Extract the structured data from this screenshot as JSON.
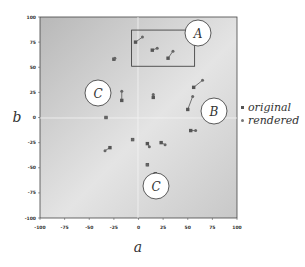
{
  "chart_data": {
    "type": "scatter",
    "title": "",
    "xlabel": "a",
    "ylabel": "b",
    "xlim": [
      -100,
      100
    ],
    "ylim": [
      -100,
      100
    ],
    "x_ticks": [
      "-100",
      "-75",
      "-50",
      "-25",
      "0",
      "25",
      "50",
      "75",
      "100"
    ],
    "y_ticks": [
      "100",
      "75",
      "50",
      "25",
      "0",
      "-25",
      "-50",
      "-75",
      "-100"
    ],
    "grid": false,
    "zero_lines": true,
    "legend": {
      "position": "right",
      "entries": [
        {
          "label": "original",
          "marker": "square"
        },
        {
          "label": "rendered",
          "marker": "dot"
        }
      ]
    },
    "pairs": [
      {
        "original": [
          -3,
          75
        ],
        "rendered": [
          4,
          80
        ]
      },
      {
        "original": [
          14,
          67
        ],
        "rendered": [
          19,
          69
        ]
      },
      {
        "original": [
          30,
          59
        ],
        "rendered": [
          35,
          66
        ]
      },
      {
        "original": [
          56,
          30
        ],
        "rendered": [
          65,
          37
        ]
      },
      {
        "original": [
          50,
          8
        ],
        "rendered": [
          55,
          21
        ]
      },
      {
        "original": [
          53,
          -13
        ],
        "rendered": [
          58,
          -13
        ]
      },
      {
        "original": [
          -25,
          58
        ],
        "rendered": [
          -24,
          59
        ]
      },
      {
        "original": [
          -17,
          17
        ],
        "rendered": [
          -17,
          26
        ]
      },
      {
        "original": [
          -33,
          0
        ],
        "rendered": [
          -33,
          0
        ]
      },
      {
        "original": [
          15,
          20
        ],
        "rendered": [
          15,
          23
        ]
      },
      {
        "original": [
          -29,
          -30
        ],
        "rendered": [
          -34,
          -33
        ]
      },
      {
        "original": [
          -6,
          -22
        ],
        "rendered": [
          -6,
          -22
        ]
      },
      {
        "original": [
          9,
          -26
        ],
        "rendered": [
          11,
          -29
        ]
      },
      {
        "original": [
          23,
          -25
        ],
        "rendered": [
          27,
          -27
        ]
      },
      {
        "original": [
          9,
          -47
        ],
        "rendered": [
          9,
          -47
        ]
      },
      {
        "original": [
          17,
          -56
        ],
        "rendered": [
          17,
          -56
        ]
      }
    ],
    "annotations": [
      {
        "label": "A",
        "type": "circle",
        "at": [
          61,
          85
        ]
      },
      {
        "label": "B",
        "type": "circle",
        "at": [
          77,
          7
        ]
      },
      {
        "label": "C",
        "type": "circle",
        "at": [
          -41,
          25
        ]
      },
      {
        "label": "C",
        "type": "circle",
        "at": [
          18,
          -68
        ]
      }
    ],
    "highlight_box": {
      "label": "A",
      "x": [
        -7,
        57
      ],
      "y": [
        51,
        87
      ]
    }
  },
  "legend": {
    "original": "original",
    "rendered": "rendered"
  },
  "axes": {
    "xlabel": "a",
    "ylabel": "b"
  },
  "circles": {
    "a": "A",
    "b": "B",
    "c1": "C",
    "c2": "C"
  },
  "ticks": {
    "x": [
      "-100",
      "-75",
      "-50",
      "-25",
      "0",
      "25",
      "50",
      "75",
      "100"
    ],
    "y": [
      "100",
      "75",
      "50",
      "25",
      "0",
      "-25",
      "-50",
      "-75",
      "-100"
    ]
  }
}
